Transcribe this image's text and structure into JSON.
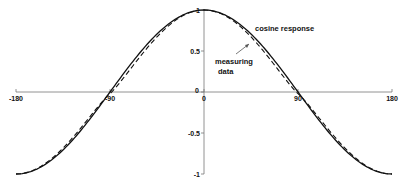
{
  "chart_data": {
    "type": "line",
    "title": "",
    "xlabel": "",
    "ylabel": "",
    "xlim": [
      -180,
      180
    ],
    "ylim": [
      -1,
      1
    ],
    "grid": false,
    "x_ticks": [
      -180,
      -90,
      0,
      90,
      180
    ],
    "x_tick_labels": [
      "-180",
      "-90",
      "0",
      "90",
      "180"
    ],
    "y_ticks": [
      1,
      0.5,
      0,
      -0.5,
      -1
    ],
    "y_tick_labels": [
      "1",
      "0.5",
      "0",
      "-0.5",
      "-1"
    ],
    "series": [
      {
        "name": "cosine response",
        "style": "solid",
        "function": "cos(x)",
        "x": [
          -180,
          -150,
          -120,
          -90,
          -60,
          -30,
          0,
          30,
          60,
          90,
          120,
          150,
          180
        ],
        "values": [
          -1,
          -0.87,
          -0.5,
          0,
          0.5,
          0.87,
          1,
          0.87,
          0.5,
          0,
          -0.5,
          -0.87,
          -1
        ]
      },
      {
        "name": "measuring data",
        "style": "dashed",
        "x": [
          -180,
          -150,
          -120,
          -90,
          -60,
          -30,
          0,
          30,
          60,
          90,
          120,
          150,
          180
        ],
        "values": [
          -1,
          -0.9,
          -0.56,
          -0.03,
          0.46,
          0.84,
          1,
          0.84,
          0.46,
          -0.03,
          -0.56,
          -0.9,
          -1
        ]
      }
    ],
    "annotations": [
      {
        "text": "cosine response",
        "x": 55,
        "y": 0.82
      },
      {
        "text": "measuring data",
        "x": 40,
        "y": 0.3,
        "arrow_to": {
          "x": 42,
          "y": 0.62
        }
      }
    ],
    "legend": null
  }
}
